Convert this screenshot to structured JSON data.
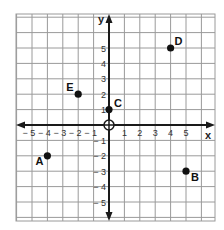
{
  "chart_data": {
    "type": "scatter",
    "title": "",
    "xlabel": "x",
    "ylabel": "y",
    "xlim": [
      -6,
      7
    ],
    "ylim": [
      -6,
      7
    ],
    "grid": true,
    "x_ticks": [
      -5,
      -4,
      -3,
      -2,
      -1,
      1,
      2,
      3,
      4,
      5
    ],
    "y_ticks": [
      5,
      4,
      3,
      2,
      1,
      -1,
      -2,
      -3,
      -4,
      -5
    ],
    "x_tick_labels": [
      "− 5",
      "− 4",
      "− 3",
      "− 2",
      "− 1",
      "1",
      "2",
      "3",
      "4",
      "5"
    ],
    "y_tick_labels": [
      "5",
      "4",
      "3",
      "2",
      "1",
      "− 1",
      "− 2",
      "− 3",
      "− 4",
      "− 5"
    ],
    "origin_marker": "open-circle",
    "points": [
      {
        "label": "A",
        "x": -4,
        "y": -2
      },
      {
        "label": "B",
        "x": 5,
        "y": -3
      },
      {
        "label": "C",
        "x": 0,
        "y": 1
      },
      {
        "label": "D",
        "x": 4,
        "y": 5
      },
      {
        "label": "E",
        "x": -2,
        "y": 2
      }
    ]
  },
  "colors": {
    "grid": "#9a9a9a",
    "axis": "#1a1a1a",
    "point": "#111111"
  }
}
